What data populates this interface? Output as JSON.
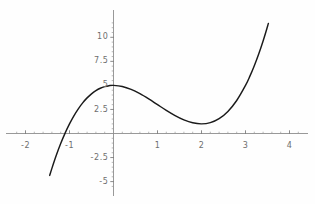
{
  "chart_data": {
    "type": "line",
    "title": "",
    "xlabel": "",
    "ylabel": "",
    "xlim": [
      -2.35,
      4.3
    ],
    "ylim": [
      -5.9,
      11.6
    ],
    "grid": false,
    "legend": null,
    "function": "x^3 - 3x^2 + 5",
    "x_ticks": [
      {
        "value": -2,
        "label": "-2"
      },
      {
        "value": -1,
        "label": "-1"
      },
      {
        "value": 1,
        "label": "1"
      },
      {
        "value": 2,
        "label": "2"
      },
      {
        "value": 3,
        "label": "3"
      },
      {
        "value": 4,
        "label": "4"
      }
    ],
    "y_ticks": [
      {
        "value": 10,
        "label": "10"
      },
      {
        "value": 7.5,
        "label": "7.5"
      },
      {
        "value": 5,
        "label": "5"
      },
      {
        "value": 2.5,
        "label": "2.5"
      },
      {
        "value": -2.5,
        "label": "-2.5"
      },
      {
        "value": -5,
        "label": "-5"
      }
    ],
    "x_minor_step": 0.2,
    "y_minor_step": 0.5,
    "series": [
      {
        "name": "cubic",
        "color": "#1a1a1a",
        "x_start": -1.45,
        "x_end": 3.52,
        "points": [
          {
            "x": -1.45,
            "y": -4.356
          },
          {
            "x": -1.4,
            "y": -3.624
          },
          {
            "x": -1.3,
            "y": -2.267
          },
          {
            "x": -1.2,
            "y": -1.048
          },
          {
            "x": -1.1,
            "y": 0.039
          },
          {
            "x": -1.0,
            "y": 1.0
          },
          {
            "x": -0.9,
            "y": 1.841
          },
          {
            "x": -0.8,
            "y": 2.568
          },
          {
            "x": -0.7,
            "y": 3.187
          },
          {
            "x": -0.6,
            "y": 3.704
          },
          {
            "x": -0.5,
            "y": 4.125
          },
          {
            "x": -0.4,
            "y": 4.456
          },
          {
            "x": -0.3,
            "y": 4.703
          },
          {
            "x": -0.2,
            "y": 4.872
          },
          {
            "x": -0.1,
            "y": 4.969
          },
          {
            "x": 0.0,
            "y": 5.0
          },
          {
            "x": 0.2,
            "y": 4.888
          },
          {
            "x": 0.4,
            "y": 4.584
          },
          {
            "x": 0.6,
            "y": 4.136
          },
          {
            "x": 0.8,
            "y": 3.592
          },
          {
            "x": 1.0,
            "y": 3.0
          },
          {
            "x": 1.2,
            "y": 2.408
          },
          {
            "x": 1.4,
            "y": 1.864
          },
          {
            "x": 1.6,
            "y": 1.416
          },
          {
            "x": 1.8,
            "y": 1.112
          },
          {
            "x": 2.0,
            "y": 1.0
          },
          {
            "x": 2.2,
            "y": 1.128
          },
          {
            "x": 2.4,
            "y": 1.544
          },
          {
            "x": 2.6,
            "y": 2.296
          },
          {
            "x": 2.8,
            "y": 3.432
          },
          {
            "x": 3.0,
            "y": 5.0
          },
          {
            "x": 3.1,
            "y": 5.959
          },
          {
            "x": 3.2,
            "y": 7.048
          },
          {
            "x": 3.3,
            "y": 8.267
          },
          {
            "x": 3.4,
            "y": 9.624
          },
          {
            "x": 3.5,
            "y": 11.125
          },
          {
            "x": 3.52,
            "y": 11.447
          }
        ]
      }
    ],
    "notes": {
      "local_max": {
        "x": 0,
        "y": 5
      },
      "local_min": {
        "x": 2,
        "y": 1
      },
      "x_intercept": -1.1
    }
  },
  "axes": {
    "x_axis_color": "#8d8d8d",
    "y_axis_color": "#8d8d8d",
    "tick_label_color": "#6e6e6e",
    "curve_color": "#1a1a1a",
    "background_color": "#fefefe"
  }
}
